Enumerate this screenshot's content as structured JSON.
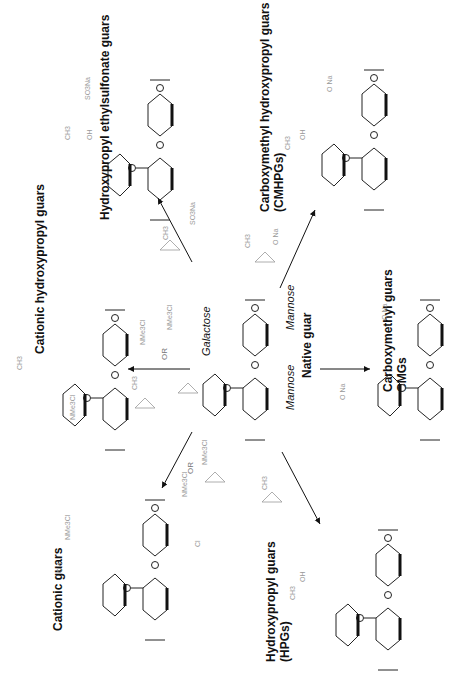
{
  "diagram": {
    "center": {
      "title": "Native guar",
      "units": [
        "Galactose",
        "Mannose",
        "Mannose"
      ],
      "atom_numbers": [
        "1",
        "2",
        "3",
        "4",
        "5",
        "6"
      ]
    },
    "products": [
      {
        "id": "hpeg",
        "title": "Hydroxypropyl ethylsulfonate guars",
        "substituents": [
          "CH3",
          "OH",
          "SO3 Na"
        ],
        "reagents": [
          "propylene oxide (CH3)",
          "sodium vinylsulfonate (SO3 Na)"
        ]
      },
      {
        "id": "cmhpg",
        "title_line1": "Carboxymethyl hydroxypropyl guars",
        "title_line2": "(CMHPGs)",
        "substituents": [
          "CH3",
          "OH",
          "O Na"
        ],
        "reagents": [
          "propylene oxide (CH3)",
          "sodium chloroacetate (O Na, Cl)"
        ]
      },
      {
        "id": "chpg",
        "title": "Cationic hydroxypropyl guars",
        "substituents": [
          "CH3",
          "OH",
          "NMe3Cl"
        ],
        "reagents": [
          "propylene oxide (CH3)",
          "Cl / OH / NMe3Cl",
          "OR",
          "epoxide NMe3Cl"
        ]
      },
      {
        "id": "cmg",
        "title_line1": "Carboxymethyl guars",
        "title_line2": "CMGs",
        "substituents": [
          "O Na"
        ],
        "reagents": [
          "sodium chloroacetate (O Na, Cl)"
        ]
      },
      {
        "id": "cg",
        "title": "Cationic guars",
        "substituents": [
          "OH",
          "NMe3Cl"
        ],
        "reagents": [
          "Cl / OH / NMe3Cl",
          "OR",
          "epoxide NMe3Cl"
        ]
      },
      {
        "id": "hpg",
        "title_line1": "Hydroxypropyl guars",
        "title_line2": "(HPGs)",
        "substituents": [
          "CH3",
          "OH"
        ],
        "reagents": [
          "propylene oxide (CH3)"
        ]
      }
    ],
    "labels": {
      "or": "OR",
      "n": "n",
      "ch3": "CH3",
      "oh": "OH",
      "ho": "HO",
      "nme3cl": "NMe3Cl",
      "so3na": "SO3Na",
      "ona": "O Na",
      "cl": "Cl",
      "o": "O"
    },
    "colors": {
      "main": "#111111",
      "reagent": "#888888",
      "background": "#ffffff"
    }
  }
}
